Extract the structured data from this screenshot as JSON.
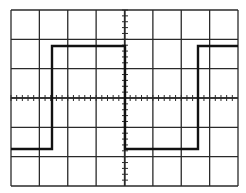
{
  "figure": {
    "colors": {
      "background": "#ffffff",
      "grid": "#2a2a2a",
      "trace": "#111111"
    },
    "graticule": {
      "left": 11,
      "top": 10,
      "right": 238,
      "bottom": 186,
      "h_divisions": 8,
      "v_divisions": 6,
      "minor_ticks_per_division": 5,
      "center_x": 125,
      "center_y": 98
    },
    "trace": {
      "type": "square-wave",
      "high_y": 46,
      "low_y": 149,
      "points": [
        [
          11,
          149
        ],
        [
          52,
          149
        ],
        [
          52,
          46
        ],
        [
          125,
          46
        ],
        [
          125,
          149
        ],
        [
          198,
          149
        ],
        [
          198,
          46
        ],
        [
          238,
          46
        ]
      ]
    }
  }
}
